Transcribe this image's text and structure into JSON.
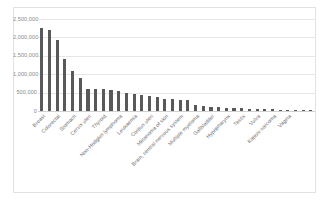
{
  "chart_data": {
    "type": "bar",
    "title": "",
    "subtitle": "",
    "xlabel": "",
    "ylabel": "",
    "ylim": [
      0,
      2500000
    ],
    "grid": true,
    "legend": null,
    "bar_color": "#595959",
    "gridline_color": "#e6e6e6",
    "frame_color": "#e2e2e2",
    "label_color": "#8a8a8a",
    "y_ticks": [
      {
        "value": 2500000,
        "label": "2,500,000"
      },
      {
        "value": 2000000,
        "label": "2,000,000"
      },
      {
        "value": 1500000,
        "label": "1,500,000"
      },
      {
        "value": 1000000,
        "label": "1,000,000"
      },
      {
        "value": 500000,
        "label": "500,000"
      },
      {
        "value": 0,
        "label": "0"
      }
    ],
    "categories": [
      "Breast",
      "Lung",
      "Colorectal",
      "Prostate",
      "Stomach",
      "Liver",
      "Cervix uteri",
      "Oesophagus",
      "Thyroid",
      "Bladder",
      "Non-Hodgkin lymphoma",
      "Pancreas",
      "Leukaemia",
      "Kidney",
      "Corpus uteri",
      "Lip, oral cavity",
      "Melanoma of skin",
      "Ovary",
      "Brain, central nervous system",
      "Larynx",
      "Multiple myeloma",
      "Nasopharynx",
      "Gallbladder",
      "Oropharynx",
      "Hypopharynx",
      "Hodgkin lymphoma",
      "Testis",
      "Salivary glands",
      "Vulva",
      "Anus",
      "Kaposi sarcoma",
      "Penis",
      "Vagina",
      "Mesothelioma",
      "Eye",
      "Bone"
    ],
    "values": [
      2261419,
      2206771,
      1931590,
      1414259,
      1089103,
      905677,
      604127,
      604100,
      586202,
      573278,
      544352,
      495773,
      474519,
      431288,
      417367,
      377713,
      324635,
      313959,
      308102,
      298042,
      176404,
      133354,
      115949,
      98412,
      84254,
      83087,
      74458,
      53583,
      45240,
      50865,
      42239,
      36068,
      17908,
      30870,
      26000,
      22000
    ]
  }
}
